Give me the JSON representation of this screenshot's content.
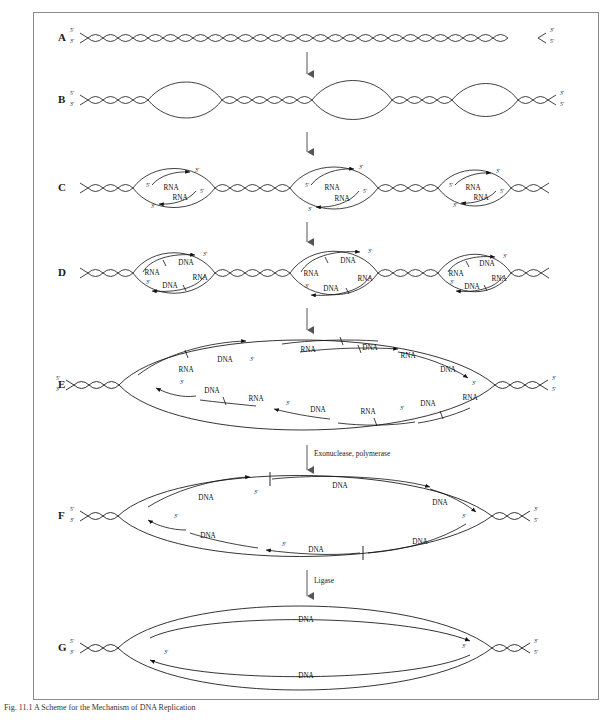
{
  "figure": {
    "caption": "Fig. 11.1    A Scheme for the Mechanism of DNA Replication",
    "frame_color": "#8a8a8a",
    "line_color": "#111111",
    "background": "#ffffff"
  },
  "labels": {
    "five_prime": "5'",
    "three_prime": "3'",
    "rna": "RNA",
    "dna": "DNA"
  },
  "rows": [
    {
      "id": "A",
      "letter": "A",
      "description": "intact parental DNA double helix",
      "end_labels_left": [
        "5'",
        "3'"
      ],
      "end_labels_right": [
        "3'",
        "5'"
      ]
    },
    {
      "id": "B",
      "letter": "B",
      "description": "three replication bubbles open along the helix",
      "end_labels_left": [
        "5'",
        "3'"
      ],
      "end_labels_right": [
        "3'",
        "5'"
      ],
      "bubble_count": 3
    },
    {
      "id": "C",
      "letter": "C",
      "description": "RNA primers synthesized in each replication bubble",
      "end_labels_left": [
        "5'",
        "3'"
      ],
      "end_labels_right": [
        "3'",
        "5'"
      ],
      "bubble_count": 3,
      "strand_labels": [
        "RNA",
        "RNA"
      ]
    },
    {
      "id": "D",
      "letter": "D",
      "description": "RNA primers extended with DNA",
      "end_labels_left": [
        "5'",
        "3'"
      ],
      "end_labels_right": [
        "3'",
        "5'"
      ],
      "bubble_count": 3,
      "strand_labels": [
        "RNA",
        "DNA",
        "DNA",
        "RNA"
      ]
    },
    {
      "id": "E",
      "letter": "E",
      "description": "bubbles fuse into one large bubble with Okazaki fragments of RNA and DNA",
      "end_labels_left": [
        "5'",
        "3'"
      ],
      "end_labels_right": [
        "3'",
        "5'"
      ],
      "bubble_count": 1,
      "strand_labels": [
        "DNA",
        "RNA",
        "DNA",
        "RNA",
        "DNA",
        "RNA",
        "DNA",
        "RNA",
        "DNA",
        "RNA",
        "DNA",
        "RNA"
      ]
    },
    {
      "id": "F",
      "letter": "F",
      "description": "RNA primers removed and replaced by DNA leaving nicks",
      "end_labels_left": [
        "5'",
        "3'"
      ],
      "end_labels_right": [
        "3'",
        "5'"
      ],
      "bubble_count": 1,
      "strand_labels": [
        "DNA",
        "DNA",
        "DNA",
        "DNA"
      ]
    },
    {
      "id": "G",
      "letter": "G",
      "description": "nicks sealed producing continuous daughter strands",
      "end_labels_left": [
        "5'",
        "3'"
      ],
      "end_labels_right": [
        "3'",
        "5'"
      ],
      "bubble_count": 1,
      "strand_labels": [
        "DNA",
        "DNA"
      ]
    }
  ],
  "transitions": [
    {
      "from": "A",
      "to": "B",
      "label": ""
    },
    {
      "from": "B",
      "to": "C",
      "label": ""
    },
    {
      "from": "C",
      "to": "D",
      "label": ""
    },
    {
      "from": "D",
      "to": "E",
      "label": ""
    },
    {
      "from": "E",
      "to": "F",
      "label": "Exonuclease, polymerase"
    },
    {
      "from": "F",
      "to": "G",
      "label": "Ligase"
    }
  ]
}
